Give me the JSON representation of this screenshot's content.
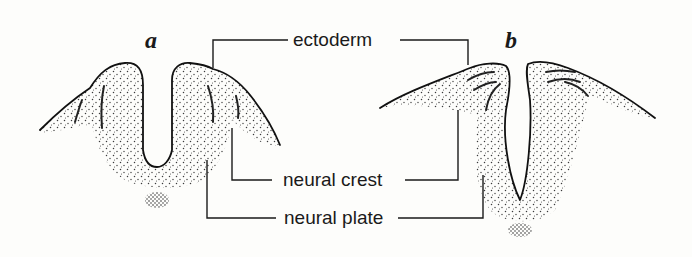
{
  "figure": {
    "panels": [
      {
        "id": "a",
        "letter": "a",
        "description": "neural groove stage"
      },
      {
        "id": "b",
        "letter": "b",
        "description": "neural folds closing stage"
      }
    ],
    "labels": {
      "ectoderm": "ectoderm",
      "neural_crest": "neural crest",
      "neural_plate": "neural plate"
    },
    "colors": {
      "ink": "#1a1a1a",
      "background": "#fdfdfb",
      "stipple": "#3a3a3a"
    }
  }
}
